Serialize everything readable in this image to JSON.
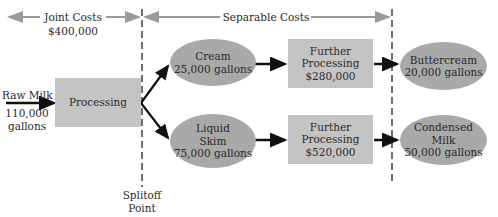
{
  "diagram": {
    "type": "joint-cost flowchart",
    "joint_costs": {
      "label": "Joint Costs",
      "amount": "$400,000"
    },
    "separable_costs": {
      "label": "Separable Costs"
    },
    "input": {
      "name": "Raw Milk",
      "qty": "110,000",
      "unit": "gallons"
    },
    "processing": {
      "label": "Processing"
    },
    "splitoff": {
      "line1": "Splitoff",
      "line2": "Point"
    },
    "products": [
      {
        "name": "Cream",
        "qty": "25,000 gallons",
        "further_processing": {
          "line1": "Further",
          "line2": "Processing",
          "cost": "$280,000"
        },
        "final": {
          "name": "Buttercream",
          "qty": "20,000 gallons"
        }
      },
      {
        "name_line1": "Liquid",
        "name_line2": "Skim",
        "qty": "75,000 gallons",
        "further_processing": {
          "line1": "Further",
          "line2": "Processing",
          "cost": "$520,000"
        },
        "final": {
          "name_line1": "Condensed",
          "name_line2": "Milk",
          "qty": "50,000 gallons"
        }
      }
    ],
    "colors": {
      "box": "#c4c4c4",
      "ellipse": "#a9a9a9",
      "cost_arrow": "#9a9a9a",
      "flow_arrow": "#111111"
    }
  }
}
